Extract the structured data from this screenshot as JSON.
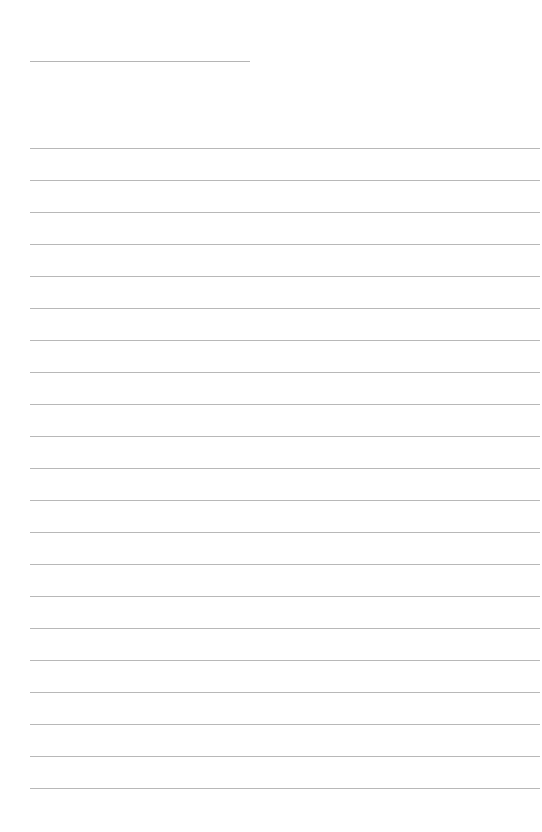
{
  "document": {
    "type": "lined-paper",
    "background_color": "#ffffff",
    "rule_color": "#b8b8b8",
    "header_line": {
      "x": 30,
      "y": 61,
      "width": 220
    },
    "ruled_lines": {
      "count": 21,
      "start_y": 148,
      "spacing": 32,
      "x": 30,
      "width": 510
    },
    "lines": [
      {
        "text": ""
      },
      {
        "text": ""
      },
      {
        "text": ""
      },
      {
        "text": ""
      },
      {
        "text": ""
      },
      {
        "text": ""
      },
      {
        "text": ""
      },
      {
        "text": ""
      },
      {
        "text": ""
      },
      {
        "text": ""
      },
      {
        "text": ""
      },
      {
        "text": ""
      },
      {
        "text": ""
      },
      {
        "text": ""
      },
      {
        "text": ""
      },
      {
        "text": ""
      },
      {
        "text": ""
      },
      {
        "text": ""
      },
      {
        "text": ""
      },
      {
        "text": ""
      },
      {
        "text": ""
      }
    ]
  }
}
